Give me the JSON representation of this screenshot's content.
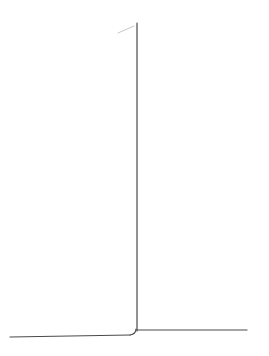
{
  "canvas": {
    "width": 269,
    "height": 356,
    "background": "#ffffff"
  },
  "strokes": {
    "color": "#4a4a4a",
    "faint_color": "#c8c8c8",
    "width": 1.2
  },
  "shapes": {
    "left_baseline": {
      "x1": 10,
      "y1": 337,
      "x2": 130,
      "y2": 335
    },
    "corner_curve": {
      "from": [
        130,
        335
      ],
      "ctrl": [
        136,
        334
      ],
      "to": [
        136,
        329
      ]
    },
    "vertical_line": {
      "x": 137,
      "y1": 23,
      "y2": 331
    },
    "right_baseline": {
      "x1": 137,
      "y1": 330,
      "x2": 247,
      "y2": 330
    },
    "faint_stroke": {
      "x1": 118,
      "y1": 33,
      "x2": 134,
      "y2": 26
    }
  }
}
